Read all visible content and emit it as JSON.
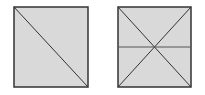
{
  "diagram": {
    "background": "#ffffff",
    "fill": "#d9d9d9",
    "stroke": "#333333",
    "shapes": [
      {
        "name": "square-with-one-diagonal",
        "x": 14,
        "y": 7,
        "width": 74,
        "height": 80,
        "lines": [
          {
            "x1": 14,
            "y1": 7,
            "x2": 88,
            "y2": 87
          }
        ]
      },
      {
        "name": "square-with-diagonals-and-midline",
        "x": 118,
        "y": 7,
        "width": 73,
        "height": 80,
        "lines": [
          {
            "x1": 118,
            "y1": 7,
            "x2": 191,
            "y2": 87
          },
          {
            "x1": 191,
            "y1": 7,
            "x2": 118,
            "y2": 87
          },
          {
            "x1": 118,
            "y1": 47,
            "x2": 191,
            "y2": 47
          }
        ]
      }
    ]
  }
}
